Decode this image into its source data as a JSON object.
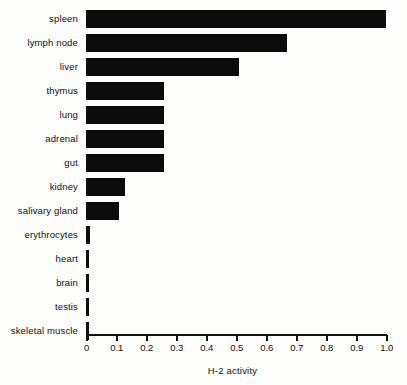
{
  "chart_data": {
    "type": "bar",
    "orientation": "horizontal",
    "title": "",
    "xlabel": "H-2 activity",
    "ylabel": "",
    "xlim": [
      0,
      1.0
    ],
    "grid": false,
    "legend": null,
    "bar_color": "#0b0b0b",
    "background_color": "#fdfdfc",
    "xticks": [
      0,
      0.1,
      0.2,
      0.3,
      0.4,
      0.5,
      0.6,
      0.7,
      0.8,
      0.9,
      1.0
    ],
    "xtick_labels": [
      "0",
      "0.1",
      "0.2",
      "0.3",
      "0.4",
      "0.5",
      "0.6",
      "0.7",
      "0.8",
      "0.9",
      "1.0"
    ],
    "categories": [
      "spleen",
      "lymph node",
      "liver",
      "thymus",
      "lung",
      "adrenal",
      "gut",
      "kidney",
      "salivary gland",
      "erythrocytes",
      "heart",
      "brain",
      "testis",
      "skeletal muscle"
    ],
    "values": [
      1.0,
      0.67,
      0.51,
      0.26,
      0.26,
      0.26,
      0.26,
      0.13,
      0.11,
      0.012,
      0.008,
      0.008,
      0.008,
      0.008
    ]
  }
}
